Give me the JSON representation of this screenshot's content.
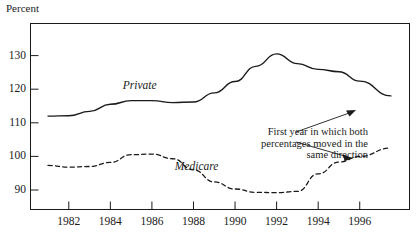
{
  "chart_data": {
    "type": "line",
    "title": "",
    "xlabel": "",
    "ylabel": "Percent",
    "xlim": [
      1981,
      1997.6
    ],
    "ylim": [
      84,
      139
    ],
    "grid": false,
    "legend": "inline-labels",
    "xticks": [
      1982,
      1984,
      1986,
      1988,
      1990,
      1992,
      1994,
      1996
    ],
    "xtick_labels": [
      "1982",
      "1984",
      "1986",
      "1988",
      "1990",
      "1992",
      "1994",
      "1996"
    ],
    "yticks": [
      90,
      100,
      110,
      120,
      130
    ],
    "ytick_labels": [
      "90",
      "100",
      "110",
      "120",
      "130"
    ],
    "series": [
      {
        "name": "Private",
        "style": "solid",
        "color": "#1a1a1a",
        "x": [
          1981.0,
          1982.0,
          1983.0,
          1984.0,
          1985.0,
          1986.0,
          1987.0,
          1988.0,
          1989.0,
          1990.0,
          1991.0,
          1992.0,
          1993.0,
          1994.0,
          1995.0,
          1996.0,
          1997.5
        ],
        "values": [
          112.0,
          112.1,
          113.4,
          115.5,
          116.6,
          116.6,
          116.0,
          116.2,
          118.9,
          122.3,
          126.8,
          130.5,
          127.6,
          125.9,
          125.2,
          122.4,
          118.0
        ]
      },
      {
        "name": "Medicare",
        "style": "dashed",
        "color": "#1a1a1a",
        "x": [
          1981.0,
          1982.0,
          1983.0,
          1984.0,
          1985.0,
          1986.0,
          1987.0,
          1988.0,
          1989.0,
          1990.0,
          1991.0,
          1992.0,
          1993.0,
          1994.0,
          1995.0,
          1996.0,
          1997.5
        ],
        "values": [
          97.3,
          96.8,
          97.0,
          98.2,
          100.5,
          100.7,
          99.3,
          96.0,
          92.4,
          90.3,
          89.3,
          89.2,
          89.6,
          94.8,
          98.3,
          100.0,
          102.5
        ]
      }
    ],
    "annotations": [
      {
        "text": "First year in which both percentages moved in the same direction",
        "lines": [
          "First year in which both",
          "percentages moved in the",
          "same direction"
        ],
        "arrows": [
          "to-private-line-end",
          "to-medicare-line-end"
        ]
      }
    ],
    "series_inline_labels": [
      {
        "name": "Private",
        "x": 1984.6,
        "y": 120.6
      },
      {
        "name": "Medicare",
        "x": 1987.1,
        "y": 96.4
      }
    ]
  }
}
